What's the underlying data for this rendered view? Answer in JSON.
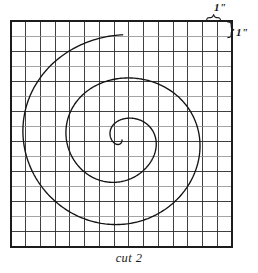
{
  "figure": {
    "caption": "cut 2",
    "background_color": "#ffffff",
    "ink_color": "#141414",
    "grid_color": "#2b2b2b",
    "grid": {
      "columns": 15,
      "rows": 15,
      "cell_inches": 1,
      "left_px": 11,
      "top_px": 21,
      "width_px": 221,
      "height_px": 226
    },
    "annotations": {
      "top": {
        "label": "1\"",
        "brace": "horizontal-brace-icon",
        "meaning": "one grid square is one inch wide"
      },
      "right": {
        "label": "1\"",
        "brace": "vertical-brace-icon",
        "meaning": "one grid square is one inch tall"
      }
    },
    "spiral": {
      "type": "archimedean",
      "turns": 2.5,
      "center_px": [
        122,
        140
      ],
      "start_radius_px": 0,
      "end_radius_px": 110,
      "stroke_width": 1.35,
      "description": "hand-drawn archimedean spiral of about two and a half turns drawn over a one-inch grid"
    }
  }
}
